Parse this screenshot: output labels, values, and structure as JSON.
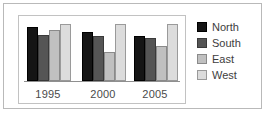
{
  "chart_data": {
    "type": "bar",
    "title": "",
    "subtitle": "",
    "xlabel": "",
    "ylabel": "",
    "categories": [
      "1995",
      "2000",
      "2005"
    ],
    "series": [
      {
        "name": "North",
        "color": "#151515",
        "values": [
          88,
          80,
          74
        ]
      },
      {
        "name": "South",
        "color": "#555555",
        "values": [
          76,
          74,
          70
        ]
      },
      {
        "name": "East",
        "color": "#c0c0c0",
        "values": [
          83,
          48,
          58
        ]
      },
      {
        "name": "West",
        "color": "#dcdcdc",
        "values": [
          94,
          94,
          94
        ]
      }
    ],
    "ylim": [
      0,
      100
    ],
    "grid": false,
    "legend_position": "right",
    "tick_labels": {
      "x": [
        "1995",
        "2000",
        "2005"
      ]
    },
    "annotations": []
  },
  "legend": {
    "items": [
      {
        "label": "North",
        "swatch": "legend-swatch-north"
      },
      {
        "label": "South",
        "swatch": "legend-swatch-south"
      },
      {
        "label": "East",
        "swatch": "legend-swatch-east"
      },
      {
        "label": "West",
        "swatch": "legend-swatch-west"
      }
    ]
  },
  "axis": {
    "x_labels": [
      "1995",
      "2000",
      "2005"
    ]
  },
  "colors": {
    "north": "#151515",
    "south": "#555555",
    "east": "#c0c0c0",
    "west": "#dcdcdc",
    "frame": "#b9b9b9",
    "plot_border": "#c2c2c2",
    "axis_line": "#8f8f8f",
    "background": "#ffffff",
    "text": "#3d3d3d"
  }
}
